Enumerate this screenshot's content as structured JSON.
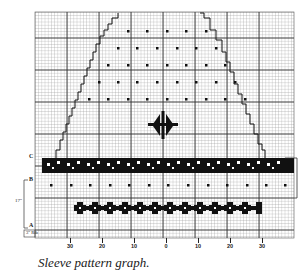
{
  "figure": {
    "caption": "Sleeve pattern graph.",
    "row_markers": {
      "c": "C",
      "b": "B",
      "a": "A"
    },
    "measurements": {
      "ab_span": "17\"",
      "bottom_span": "3\" Rib"
    },
    "x_axis_labels": [
      "30",
      "20",
      "10",
      "0",
      "10",
      "20",
      "30"
    ],
    "colors": {
      "grid_minor": "#9a9a9a",
      "grid_major": "#3a3a3a",
      "ink": "#111111",
      "paper": "#ffffff"
    }
  }
}
